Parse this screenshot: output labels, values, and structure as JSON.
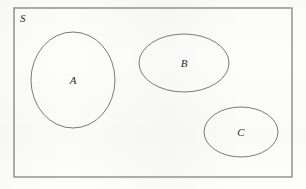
{
  "figure": {
    "kind": "set-diagram",
    "width": 306,
    "height": 189,
    "background_color": "#fdfdfc",
    "outline_color": "#6a6a6a",
    "universe_border_color": "#8a8a8a",
    "label_color": "#2b2b2b"
  },
  "universe": {
    "label": "S",
    "label_x": 20,
    "label_y": 22,
    "rect": {
      "x": 14,
      "y": 8,
      "width": 278,
      "height": 169
    }
  },
  "sets": [
    {
      "label": "A",
      "shape": "ellipse",
      "cx": 73,
      "cy": 80,
      "rx": 42,
      "ry": 48,
      "label_x": 73,
      "label_y": 84
    },
    {
      "label": "B",
      "shape": "ellipse",
      "cx": 184,
      "cy": 63,
      "rx": 45,
      "ry": 29,
      "label_x": 184,
      "label_y": 67
    },
    {
      "label": "C",
      "shape": "ellipse",
      "cx": 241,
      "cy": 132,
      "rx": 37,
      "ry": 25,
      "label_x": 241,
      "label_y": 136
    }
  ]
}
